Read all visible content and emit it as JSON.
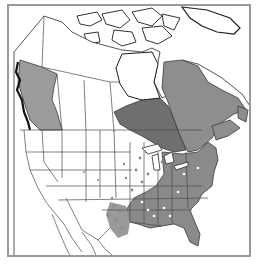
{
  "map": {
    "type": "species-range-map",
    "region": "North America",
    "frame_color": "#9a9a9a",
    "boundary_color": "#4a4a4a",
    "coast_color": "#1e1e1e",
    "land_color": "#ffffff",
    "legend": [],
    "shaded_regions": [
      {
        "name": "British Columbia",
        "shade": "#9c9c9c"
      },
      {
        "name": "Ontario",
        "shade": "#6f6f6f"
      },
      {
        "name": "Quebec",
        "shade": "#8e8e8e"
      },
      {
        "name": "Maritime provinces",
        "shade": "#8e8e8e"
      },
      {
        "name": "Eastern United States",
        "shade": "#8a8a8a"
      },
      {
        "name": "Southeastern United States",
        "shade": "#8a8a8a"
      },
      {
        "name": "Florida",
        "shade": "#8a8a8a"
      }
    ],
    "dotted_regions": [
      {
        "name": "East Texas",
        "dot": "#8a8a8a"
      },
      {
        "name": "Oklahoma",
        "dot": "#8a8a8a"
      },
      {
        "name": "Great Lakes states",
        "dot": "#8a8a8a"
      },
      {
        "name": "Midwest",
        "dot": "#8a8a8a"
      }
    ]
  }
}
